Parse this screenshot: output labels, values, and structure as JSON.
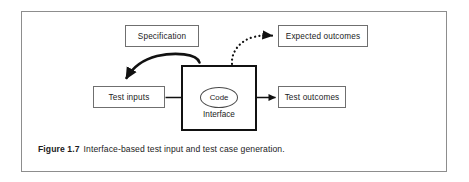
{
  "figure": {
    "caption_label": "Figure 1.7",
    "caption_text": "Interface-based test input and test case generation.",
    "frame_color": "#8d8d8d",
    "background": "#ffffff"
  },
  "diagram": {
    "type": "flow-diagram",
    "nodes": [
      {
        "id": "specification",
        "label": "Specification",
        "shape": "rectangle"
      },
      {
        "id": "expected-outcomes",
        "label": "Expected outcomes",
        "shape": "rectangle"
      },
      {
        "id": "test-inputs",
        "label": "Test inputs",
        "shape": "rectangle"
      },
      {
        "id": "test-outcomes",
        "label": "Test outcomes",
        "shape": "rectangle"
      },
      {
        "id": "interface",
        "label": "Interface",
        "shape": "thick-rectangle"
      },
      {
        "id": "code",
        "label": "Code",
        "shape": "ellipse"
      }
    ],
    "edges": [
      {
        "from": "specification",
        "to": "test-inputs",
        "style": "solid-curved-thick",
        "arrow": "filled"
      },
      {
        "from": "interface",
        "to": "expected-outcomes",
        "style": "dotted-curved",
        "arrow": "filled"
      },
      {
        "from": "test-inputs",
        "to": "code",
        "style": "solid-straight",
        "arrow": "filled"
      },
      {
        "from": "code",
        "to": "test-outcomes",
        "style": "solid-straight",
        "arrow": "filled"
      }
    ],
    "line_color": "#111111"
  }
}
